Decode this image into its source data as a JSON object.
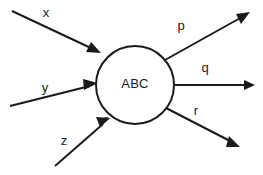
{
  "diagram": {
    "type": "black-box-process-diagram",
    "background_color": "#ffffff",
    "stroke_color": "#1a1a1a",
    "process": {
      "label": "ABC",
      "shape": "circle",
      "center_x": 135,
      "center_y": 85,
      "radius": 39
    },
    "inputs": [
      {
        "label": "x",
        "label_x": 46,
        "label_y": 14,
        "start_x": 12,
        "start_y": 11,
        "end_x": 100,
        "end_y": 53,
        "direction": "into-process"
      },
      {
        "label": "y",
        "label_x": 45,
        "label_y": 89,
        "start_x": 10,
        "start_y": 106,
        "end_x": 96,
        "end_y": 85,
        "direction": "into-process"
      },
      {
        "label": "z",
        "label_x": 64,
        "label_y": 142,
        "start_x": 55,
        "start_y": 166,
        "end_x": 109,
        "end_y": 119,
        "direction": "into-process"
      }
    ],
    "outputs": [
      {
        "label": "p",
        "label_x": 181,
        "label_y": 27,
        "start_x": 165,
        "start_y": 60,
        "end_x": 249,
        "end_y": 12,
        "direction": "out-of-process"
      },
      {
        "label": "q",
        "label_x": 205,
        "label_y": 69,
        "start_x": 174,
        "start_y": 85,
        "end_x": 254,
        "end_y": 85,
        "direction": "out-of-process"
      },
      {
        "label": "r",
        "label_x": 196,
        "label_y": 112,
        "start_x": 166,
        "start_y": 108,
        "end_x": 239,
        "end_y": 146,
        "direction": "out-of-process"
      }
    ]
  }
}
